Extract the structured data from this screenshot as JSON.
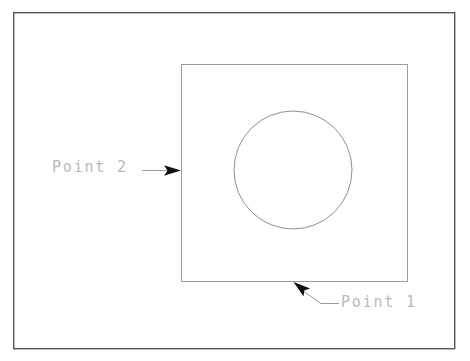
{
  "drawing": {
    "title_caption": "",
    "background_color": "#ffffff",
    "outer_frame": {
      "name": "outer-border-frame",
      "x": 13,
      "y": 12,
      "width": 442,
      "height": 337,
      "stroke": "#555555",
      "stroke_width": 1.4,
      "fill": "none"
    },
    "inner_square": {
      "name": "inner-square",
      "x": 181,
      "y": 64,
      "width": 227,
      "height": 218,
      "stroke": "#9a9a9a",
      "stroke_width": 1,
      "fill": "none"
    },
    "circle": {
      "name": "circle-hole",
      "cx": 293,
      "cy": 170,
      "r": 59,
      "stroke": "#8e8e8e",
      "stroke_width": 1,
      "fill": "none"
    },
    "leaders": [
      {
        "name": "leader-point-2",
        "label": "Point 2",
        "stroke": "#9a9a9a",
        "stroke_width": 1,
        "line_points": "142,170 174,170",
        "arrow_tip": {
          "x": 181,
          "y": 170
        },
        "arrow_points": "181,170 165,165 168,170 165,175",
        "arrow_fill": "#111111"
      },
      {
        "name": "leader-point-1",
        "label": "Point 1",
        "stroke": "#9a9a9a",
        "stroke_width": 1,
        "line_points": "303,290 321,303 338,303",
        "arrow_tip": {
          "x": 294,
          "y": 282
        },
        "arrow_points": "294,282 309,288 304,290 304,296",
        "arrow_fill": "#111111"
      }
    ],
    "labels": [
      {
        "id": "point-2",
        "text": "Point 2",
        "color": "#b9b9b9"
      },
      {
        "id": "point-1",
        "text": "Point 1",
        "color": "#b9b9b9"
      }
    ]
  }
}
